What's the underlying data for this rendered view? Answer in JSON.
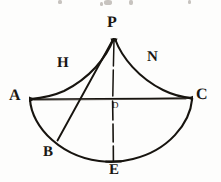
{
  "figure": {
    "kind": "geometry-diagram",
    "medium": "engraved-print",
    "ink_color": "#17140f",
    "paper_color": "#fdfdfc",
    "canvas": {
      "width": 221,
      "height": 182
    },
    "labels": [
      {
        "id": "P",
        "text": "P",
        "role": "apex-vertex",
        "x": 107,
        "y": 15,
        "size": "big"
      },
      {
        "id": "H",
        "text": "H",
        "role": "left-curve-label",
        "x": 57,
        "y": 56,
        "size": "mid"
      },
      {
        "id": "N",
        "text": "N",
        "role": "right-curve-label",
        "x": 147,
        "y": 50,
        "size": "mid"
      },
      {
        "id": "A",
        "text": "A",
        "role": "left-vertex",
        "x": 9,
        "y": 88,
        "size": "big"
      },
      {
        "id": "C",
        "text": "C",
        "role": "right-vertex",
        "x": 196,
        "y": 87,
        "size": "big"
      },
      {
        "id": "D",
        "text": "D",
        "role": "center-point",
        "x": 112,
        "y": 101,
        "size": "small"
      },
      {
        "id": "B",
        "text": "B",
        "role": "lower-left-point",
        "x": 43,
        "y": 145,
        "size": "mid"
      },
      {
        "id": "E",
        "text": "E",
        "role": "bottom-point",
        "x": 109,
        "y": 163,
        "size": "mid"
      }
    ],
    "points": {
      "P": {
        "x": 114,
        "y": 38
      },
      "A": {
        "x": 30,
        "y": 99
      },
      "C": {
        "x": 192,
        "y": 98
      },
      "D": {
        "x": 112,
        "y": 99
      },
      "B": {
        "x": 57,
        "y": 141
      },
      "E": {
        "x": 113,
        "y": 162
      }
    },
    "strokes": [
      {
        "id": "curve-PA",
        "name": "left-concave-curve",
        "from": "P",
        "to": "A",
        "type": "curve"
      },
      {
        "id": "curve-PC",
        "name": "right-concave-curve",
        "from": "P",
        "to": "C",
        "type": "curve"
      },
      {
        "id": "line-AC",
        "name": "horizontal-chord",
        "from": "A",
        "to": "C",
        "type": "line"
      },
      {
        "id": "line-PE",
        "name": "vertical-axis",
        "from": "P",
        "to": "E",
        "type": "line"
      },
      {
        "id": "line-PB",
        "name": "oblique-line",
        "from": "P",
        "to": "B",
        "type": "line"
      },
      {
        "id": "arc-AEC",
        "name": "bottom-arc",
        "from": "A",
        "to": "C",
        "via": "E",
        "type": "arc"
      }
    ]
  }
}
